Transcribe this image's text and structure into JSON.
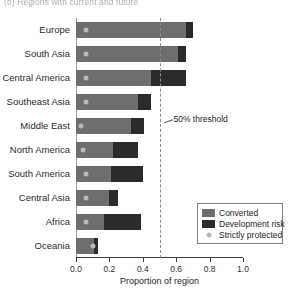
{
  "figure": {
    "panel_label": "(b) Regions with current and future",
    "xlabel": "Proportion of region"
  },
  "annotation": {
    "threshold_label": "50% threshold",
    "threshold_value": 0.5
  },
  "legend": {
    "items": [
      {
        "label": "Converted",
        "color": "#6e6e6e",
        "marker": "swatch"
      },
      {
        "label": "Development risk",
        "color": "#2b2b2b",
        "marker": "swatch"
      },
      {
        "label": "Strictly protected",
        "color": "#b9b9b9",
        "marker": "dot"
      }
    ]
  },
  "axis": {
    "ticks": [
      "0.0",
      "0.2",
      "0.4",
      "0.6",
      "0.8",
      "1.0"
    ],
    "tick_values": [
      0.0,
      0.2,
      0.4,
      0.6,
      0.8,
      1.0
    ],
    "xmin": 0.0,
    "xmax": 1.0
  },
  "chart_data": {
    "type": "bar",
    "orientation": "horizontal",
    "stacked": true,
    "title": "(b) Regions with current and future",
    "xlabel": "Proportion of region",
    "ylabel": "",
    "xlim": [
      0.0,
      1.0
    ],
    "grid": false,
    "legend_position": "lower-right",
    "categories": [
      "Europe",
      "South Asia",
      "Central America",
      "Southeast Asia",
      "Middle East",
      "North America",
      "South America",
      "Central Asia",
      "Africa",
      "Oceania"
    ],
    "series": [
      {
        "name": "Converted",
        "color": "#6e6e6e",
        "values": [
          0.66,
          0.61,
          0.45,
          0.37,
          0.33,
          0.22,
          0.21,
          0.2,
          0.17,
          0.11
        ]
      },
      {
        "name": "Development risk",
        "color": "#2b2b2b",
        "values": [
          0.04,
          0.05,
          0.21,
          0.08,
          0.08,
          0.15,
          0.19,
          0.05,
          0.22,
          0.02
        ]
      }
    ],
    "point_series": [
      {
        "name": "Strictly protected",
        "color": "#b9b9b9",
        "marker": "circle",
        "values": [
          0.06,
          0.06,
          0.06,
          0.06,
          0.03,
          0.04,
          0.06,
          0.06,
          0.06,
          0.1
        ]
      }
    ],
    "totals": [
      0.7,
      0.66,
      0.66,
      0.45,
      0.41,
      0.37,
      0.4,
      0.25,
      0.39,
      0.13
    ],
    "annotations": [
      {
        "text": "50% threshold",
        "type": "vline",
        "x": 0.5,
        "style": "dashed"
      }
    ]
  }
}
